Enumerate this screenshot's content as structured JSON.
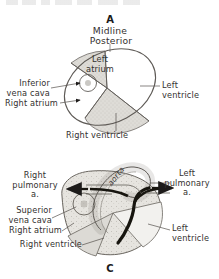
{
  "figure": {
    "title_fragment_visible": false,
    "background_color": "#ffffff",
    "ink_color": "#34312f",
    "shade_color": "#cfcdc8"
  },
  "panel_a": {
    "letter": "A",
    "header_line1": "Midline",
    "header_line2": "Posterior",
    "labels": {
      "left_atrium": "Left\natrium",
      "inferior_vena_cava": "Inferior\nvena cava",
      "right_atrium": "Right atrium",
      "left_ventricle": "Left\nventricle",
      "right_ventricle": "Right ventricle"
    }
  },
  "panel_c": {
    "letter": "C",
    "labels": {
      "aorta": "aorta",
      "right_pulmonary_artery": "Right\npulmonary\na.",
      "left_pulmonary_artery": "Left\npulmonary\na.",
      "superior_vena_cava": "Superior\nvena cava",
      "right_atrium": "Right atrium",
      "right_ventricle": "Right ventricle",
      "left_ventricle": "Left\nventricle"
    }
  }
}
